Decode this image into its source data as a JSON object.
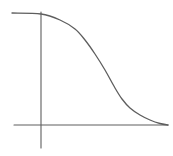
{
  "chart_data": {
    "type": "line",
    "title": "",
    "xlabel": "",
    "ylabel": "",
    "grid": false,
    "legend": null,
    "series": [
      {
        "name": "curve",
        "points_px": [
          [
            12,
            13
          ],
          [
            41,
            14
          ],
          [
            60,
            20
          ],
          [
            75,
            29
          ],
          [
            85,
            40
          ],
          [
            95,
            54
          ],
          [
            105,
            70
          ],
          [
            115,
            88
          ],
          [
            122,
            99
          ],
          [
            130,
            108
          ],
          [
            140,
            115
          ],
          [
            150,
            120
          ],
          [
            160,
            123.5
          ],
          [
            168,
            125
          ]
        ]
      }
    ],
    "axes": {
      "x_axis": {
        "y_px": 125,
        "x_start_px": 14,
        "x_end_px": 168
      },
      "y_axis": {
        "x_px": 41,
        "y_start_px": 12,
        "y_end_px": 148
      }
    }
  },
  "colors": {
    "background": "#ffffff",
    "stroke": "#5e5e5e"
  }
}
